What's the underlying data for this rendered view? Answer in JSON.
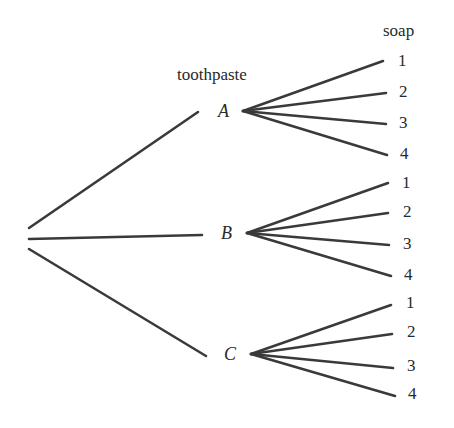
{
  "diagram": {
    "type": "tree",
    "headers": {
      "level1": "toothpaste",
      "level2": "soap"
    },
    "line_color": "#3a3a3a",
    "text_color": "#2a2a2a",
    "root": {
      "x": 29,
      "y": 239
    },
    "branches": [
      {
        "label": "A",
        "label_pos": [
          218,
          102
        ],
        "edge": [
          29,
          228,
          198,
          112
        ],
        "fan_origin": [
          243,
          111
        ],
        "leaves": [
          {
            "label": "1",
            "end": [
              383,
              61
            ],
            "label_pos": [
              398,
              52
            ]
          },
          {
            "label": "2",
            "end": [
              386,
              93
            ],
            "label_pos": [
              399,
              83
            ]
          },
          {
            "label": "3",
            "end": [
              386,
              124
            ],
            "label_pos": [
              399,
              114
            ]
          },
          {
            "label": "4",
            "end": [
              387,
              155
            ],
            "label_pos": [
              400,
              145
            ]
          }
        ]
      },
      {
        "label": "B",
        "label_pos": [
          221,
          224
        ],
        "edge": [
          29,
          239,
          202,
          235
        ],
        "fan_origin": [
          247,
          233
        ],
        "leaves": [
          {
            "label": "1",
            "end": [
              388,
              183
            ],
            "label_pos": [
              402,
              174
            ]
          },
          {
            "label": "2",
            "end": [
              388,
              213
            ],
            "label_pos": [
              403,
              203
            ]
          },
          {
            "label": "3",
            "end": [
              389,
              245
            ],
            "label_pos": [
              403,
              235
            ]
          },
          {
            "label": "4",
            "end": [
              391,
              276
            ],
            "label_pos": [
              404,
              266
            ]
          }
        ]
      },
      {
        "label": "C",
        "label_pos": [
          224,
          345
        ],
        "edge": [
          29,
          249,
          206,
          356
        ],
        "fan_origin": [
          251,
          354
        ],
        "leaves": [
          {
            "label": "1",
            "end": [
              391,
              305
            ],
            "label_pos": [
              406,
              294
            ]
          },
          {
            "label": "2",
            "end": [
              392,
              334
            ],
            "label_pos": [
              407,
              323
            ]
          },
          {
            "label": "3",
            "end": [
              393,
              368
            ],
            "label_pos": [
              407,
              357
            ]
          },
          {
            "label": "4",
            "end": [
              395,
              396
            ],
            "label_pos": [
              408,
              385
            ]
          }
        ]
      }
    ]
  }
}
